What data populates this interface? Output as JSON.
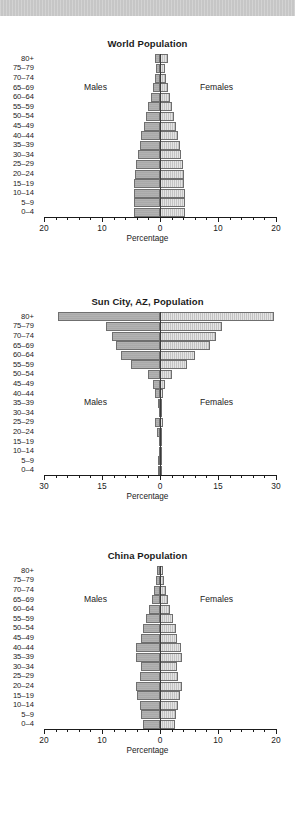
{
  "page": {
    "background_color": "#ffffff",
    "band_color": "#c6c6c6"
  },
  "style": {
    "male_color": "#a9a9a9",
    "female_color": "#c3c3c3",
    "bar_border_color": "#6f6f6f",
    "axis_color": "#1b1b1b"
  },
  "labels": {
    "males": "Males",
    "females": "Females",
    "percentage": "Percentage"
  },
  "age_groups": [
    "80+",
    "75–79",
    "70–74",
    "65–69",
    "60–64",
    "55–59",
    "50–54",
    "45–49",
    "40–44",
    "35–39",
    "30–34",
    "25–29",
    "20–24",
    "15–19",
    "10–14",
    "5–9",
    "0–4"
  ],
  "chart_data": [
    {
      "type": "bar",
      "subtype": "population-pyramid",
      "title": "World Population",
      "xlabel": "Percentage",
      "ylabel": "",
      "categories": [
        "80+",
        "75–79",
        "70–74",
        "65–69",
        "60–64",
        "55–59",
        "50–54",
        "45–49",
        "40–44",
        "35–39",
        "30–34",
        "25–29",
        "20–24",
        "15–19",
        "10–14",
        "5–9",
        "0–4"
      ],
      "xlim": [
        -20,
        20
      ],
      "xticks": [
        20,
        10,
        0,
        10,
        20
      ],
      "xtick_labels": [
        "20",
        "10",
        "0",
        "10",
        "20"
      ],
      "grid": false,
      "legend": [
        "Males",
        "Females"
      ],
      "legend_position": "inside-left-right",
      "series": [
        {
          "name": "Males",
          "side": "left",
          "values": [
            0.9,
            0.7,
            0.9,
            1.2,
            1.6,
            2.0,
            2.4,
            2.8,
            3.2,
            3.5,
            3.8,
            4.1,
            4.3,
            4.4,
            4.5,
            4.5,
            4.5
          ]
        },
        {
          "name": "Females",
          "side": "right",
          "values": [
            1.3,
            0.8,
            1.0,
            1.3,
            1.7,
            2.0,
            2.4,
            2.7,
            3.1,
            3.4,
            3.7,
            3.9,
            4.1,
            4.2,
            4.3,
            4.3,
            4.3
          ]
        }
      ]
    },
    {
      "type": "bar",
      "subtype": "population-pyramid",
      "title": "Sun City, AZ, Population",
      "xlabel": "Percentage",
      "ylabel": "",
      "categories": [
        "80+",
        "75–79",
        "70–74",
        "65–69",
        "60–64",
        "55–59",
        "50–54",
        "45–49",
        "40–44",
        "35–39",
        "30–34",
        "25–29",
        "20–24",
        "15–19",
        "10–14",
        "5–9",
        "0–4"
      ],
      "xlim": [
        -30,
        30
      ],
      "xticks": [
        30,
        15,
        0,
        15,
        30
      ],
      "xtick_labels": [
        "30",
        "15",
        "0",
        "15",
        "30"
      ],
      "grid": false,
      "legend": [
        "Males",
        "Females"
      ],
      "legend_position": "inside-left-right",
      "series": [
        {
          "name": "Males",
          "side": "left",
          "values": [
            26.5,
            14.0,
            12.5,
            11.5,
            10.0,
            7.5,
            3.0,
            1.8,
            1.3,
            0.4,
            0.3,
            1.2,
            0.8,
            0.3,
            0.3,
            0.5,
            0.4
          ]
        },
        {
          "name": "Females",
          "side": "right",
          "values": [
            29.5,
            16.0,
            14.5,
            13.0,
            9.0,
            7.0,
            3.0,
            1.2,
            0.8,
            0.3,
            0.2,
            0.9,
            0.5,
            0.2,
            0.2,
            0.3,
            0.3
          ]
        }
      ]
    },
    {
      "type": "bar",
      "subtype": "population-pyramid",
      "title": "China Population",
      "xlabel": "Percentage",
      "ylabel": "",
      "categories": [
        "80+",
        "75–79",
        "70–74",
        "65–69",
        "60–64",
        "55–59",
        "50–54",
        "45–49",
        "40–44",
        "35–39",
        "30–34",
        "25–29",
        "20–24",
        "15–19",
        "10–14",
        "5–9",
        "0–4"
      ],
      "xlim": [
        -20,
        20
      ],
      "xticks": [
        20,
        10,
        0,
        10,
        20
      ],
      "xtick_labels": [
        "20",
        "10",
        "0",
        "10",
        "20"
      ],
      "grid": false,
      "legend": [
        "Males",
        "Females"
      ],
      "legend_position": "inside-left-right",
      "series": [
        {
          "name": "Males",
          "side": "left",
          "values": [
            0.5,
            0.7,
            1.0,
            1.4,
            1.9,
            2.4,
            3.0,
            3.2,
            4.1,
            4.2,
            3.3,
            3.4,
            4.2,
            3.9,
            3.5,
            3.2,
            3.0
          ]
        },
        {
          "name": "Females",
          "side": "right",
          "values": [
            0.6,
            0.7,
            1.0,
            1.3,
            1.8,
            2.2,
            2.7,
            2.9,
            3.7,
            3.8,
            3.0,
            3.1,
            3.8,
            3.5,
            3.1,
            2.8,
            2.6
          ]
        }
      ]
    }
  ]
}
